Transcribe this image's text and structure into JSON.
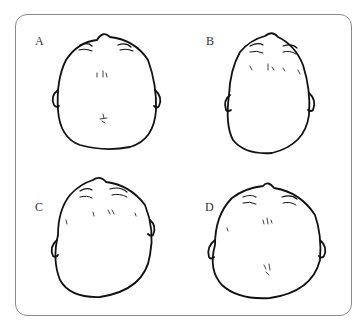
{
  "figure": {
    "panels": [
      {
        "label": "A",
        "description": "Head shape viewed from above, symmetric, posterior flattening with hair whorl at back"
      },
      {
        "label": "B",
        "description": "Head shape viewed from above, elongated oval"
      },
      {
        "label": "C",
        "description": "Head shape viewed from above, asymmetric skewed"
      },
      {
        "label": "D",
        "description": "Head shape viewed from above, wide rounded with hair whorl"
      }
    ],
    "colors": {
      "outline": "#111111",
      "frame": "#8a8a8a",
      "label": "#333333"
    }
  }
}
